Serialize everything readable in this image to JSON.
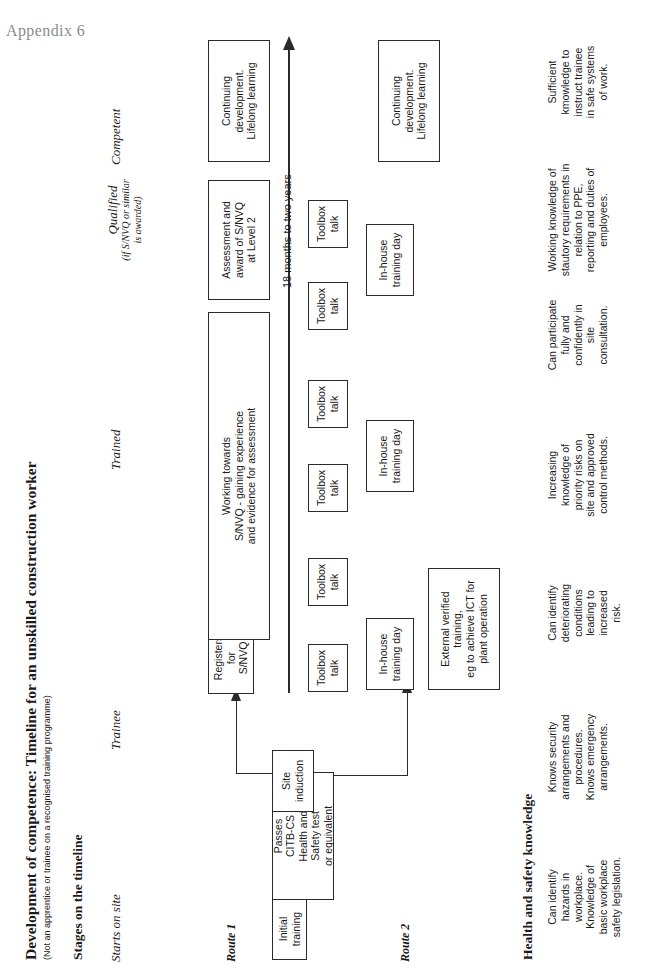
{
  "page": {
    "appendix_label": "Appendix 6",
    "title": "Development of competence: Timeline for an unskilled construction worker",
    "subtitle": "(Not an apprentice or trainee on a recognised training programme)",
    "stages_heading": "Stages on the timeline",
    "knowledge_heading": "Health and safety knowledge"
  },
  "stages": [
    {
      "name": "Starts on site",
      "sub": ""
    },
    {
      "name": "Trainee",
      "sub": ""
    },
    {
      "name": "Trained",
      "sub": ""
    },
    {
      "name": "Qualified",
      "sub": "(if S/NVQ or similar\nis awarded)"
    },
    {
      "name": "Competent",
      "sub": ""
    }
  ],
  "routes": {
    "route1_label": "Route 1",
    "route2_label": "Route 2"
  },
  "timeline": {
    "duration_label": "18 months to two years",
    "arrow_direction": "up"
  },
  "boxes": {
    "initial_training": "Initial\ntraining",
    "citb_test": "Passes\nCITB-CS\nHealth and\nSafety test\nor equivalent",
    "site_induction": "Site\ninduction",
    "registers_nvq": "Registers\nfor\nS/NVQ",
    "working_towards": "Working towards\nS/NVQ - gaining experience\nand evidence for assessment",
    "assessment_award": "Assessment and\naward of S/NVQ\nat Level 2",
    "continuing_development": "Continuing\ndevelopment.\nLifelong learning",
    "external_training": "External verified training,\neg to achieve ICT for\nplant operation",
    "toolbox_talk": "Toolbox\ntalk",
    "in_house_training": "In-house\ntraining day"
  },
  "repeats": {
    "toolbox_talk_count": 6,
    "in_house_training_count": 3,
    "continuing_development_count": 2
  },
  "knowledge": [
    "Can identify\nhazards in\nworkplace.\nKnowledge of\nbasic workplace\nsafety legislation.",
    "Knows security\narrangements and\nprocedures.\nKnows emergency\narrangements.",
    "Can identify\ndeteriorating\nconditions\nleading to\nincreased\nrisk.",
    "Increasing\nknowledge of\npriority risks on\nsite and approved\ncontrol methods.",
    "Can participate\nfully and\nconfidently in\nsite\nconsultation.",
    "Working knowledge of\nstautory requirements in\nrelation to PPE,\nreporting and duties of\nemployees.",
    "Sufficient\nkmowledge to\ninstruct trainee\nin safe systems\nof work."
  ],
  "colors": {
    "ink": "#1a1a1a",
    "line": "#2b2b2b",
    "appendix": "#8c8c8c",
    "background": "#ffffff"
  }
}
